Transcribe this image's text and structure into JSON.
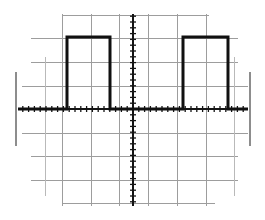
{
  "display": {
    "kind": "oscilloscope-graticule",
    "title": "Square wave on oscilloscope graticule",
    "width": 265,
    "height": 220,
    "background_color": "#ffffff",
    "grid_color": "#9d9d9d",
    "grid_color_faint": "#b9b9b9",
    "axis_color": "#141414",
    "trace_color": "#101010",
    "bezel_mark_color": "#8d8d8d"
  },
  "graticule": {
    "note": "Hand-drawn / scanned graticule. Vertical and horizontal rules at roughly one-division spacing; ragged line ends.",
    "divisions_x": 8,
    "divisions_y": 8,
    "division_px_x": 29.2,
    "division_px_y": 23.2,
    "center_x": 133,
    "center_y": 109,
    "vertical_lines": [
      {
        "x": 45,
        "y1": 57,
        "y2": 196,
        "color": "#b9b9b9"
      },
      {
        "x": 62,
        "y1": 14,
        "y2": 206,
        "color": "#9d9d9d"
      },
      {
        "x": 91,
        "y1": 14,
        "y2": 206,
        "color": "#9d9d9d"
      },
      {
        "x": 119,
        "y1": 14,
        "y2": 206,
        "color": "#9d9d9d"
      },
      {
        "x": 148,
        "y1": 14,
        "y2": 206,
        "color": "#9d9d9d"
      },
      {
        "x": 177,
        "y1": 14,
        "y2": 206,
        "color": "#9d9d9d"
      },
      {
        "x": 206,
        "y1": 14,
        "y2": 206,
        "color": "#9d9d9d"
      },
      {
        "x": 234,
        "y1": 57,
        "y2": 196,
        "color": "#b9b9b9"
      }
    ],
    "horizontal_lines": [
      {
        "y": 15,
        "x1": 62,
        "x2": 209,
        "color": "#9d9d9d"
      },
      {
        "y": 38,
        "x1": 31,
        "x2": 238,
        "color": "#9d9d9d"
      },
      {
        "y": 62,
        "x1": 31,
        "x2": 238,
        "color": "#9d9d9d"
      },
      {
        "y": 86,
        "x1": 22,
        "x2": 248,
        "color": "#9d9d9d"
      },
      {
        "y": 133,
        "x1": 22,
        "x2": 248,
        "color": "#9d9d9d"
      },
      {
        "y": 156,
        "x1": 31,
        "x2": 238,
        "color": "#9d9d9d"
      },
      {
        "y": 180,
        "x1": 31,
        "x2": 238,
        "color": "#9d9d9d"
      },
      {
        "y": 203,
        "x1": 62,
        "x2": 215,
        "color": "#9d9d9d"
      }
    ],
    "bezel_marks": [
      {
        "name": "left-edge-mark",
        "x": 16,
        "y1": 72,
        "y2": 146
      },
      {
        "name": "right-edge-mark",
        "x": 250,
        "y1": 72,
        "y2": 146
      }
    ]
  },
  "axes": {
    "horizontal": {
      "y": 109,
      "x1": 18,
      "x2": 248,
      "tick_spacing_px": 5.8,
      "tick_half_len": 3,
      "label": "time axis"
    },
    "vertical": {
      "x": 133,
      "y1": 14,
      "y2": 206,
      "tick_spacing_px": 5.8,
      "tick_half_len": 3,
      "label": "voltage axis"
    }
  },
  "chart_data": {
    "type": "line",
    "title": "Square wave on oscilloscope graticule",
    "xlabel": "time (divisions)",
    "ylabel": "voltage (divisions)",
    "xlim": [
      -4,
      4
    ],
    "ylim": [
      -4,
      4
    ],
    "grid": true,
    "legend": "none",
    "series": [
      {
        "name": "square-wave-trace",
        "color": "#101010",
        "line_width_px": 3,
        "waveform": "square",
        "duty_cycle_percent": 50,
        "period_divisions": 4,
        "low_level_divisions": 0,
        "high_level_divisions": 3.1,
        "x_pixels": [
          18,
          67,
          67,
          110,
          110,
          183,
          183,
          228,
          228,
          248
        ],
        "y_pixels": [
          109,
          109,
          37,
          37,
          109,
          109,
          37,
          37,
          109,
          109
        ],
        "points": [
          {
            "x": -3.94,
            "y": 0
          },
          {
            "x": -2.26,
            "y": 0
          },
          {
            "x": -2.26,
            "y": 3.1
          },
          {
            "x": -0.79,
            "y": 3.1
          },
          {
            "x": -0.79,
            "y": 0
          },
          {
            "x": 1.71,
            "y": 0
          },
          {
            "x": 1.71,
            "y": 3.1
          },
          {
            "x": 3.25,
            "y": 3.1
          },
          {
            "x": 3.25,
            "y": 0
          },
          {
            "x": 3.94,
            "y": 0
          }
        ]
      }
    ],
    "annotations": []
  }
}
